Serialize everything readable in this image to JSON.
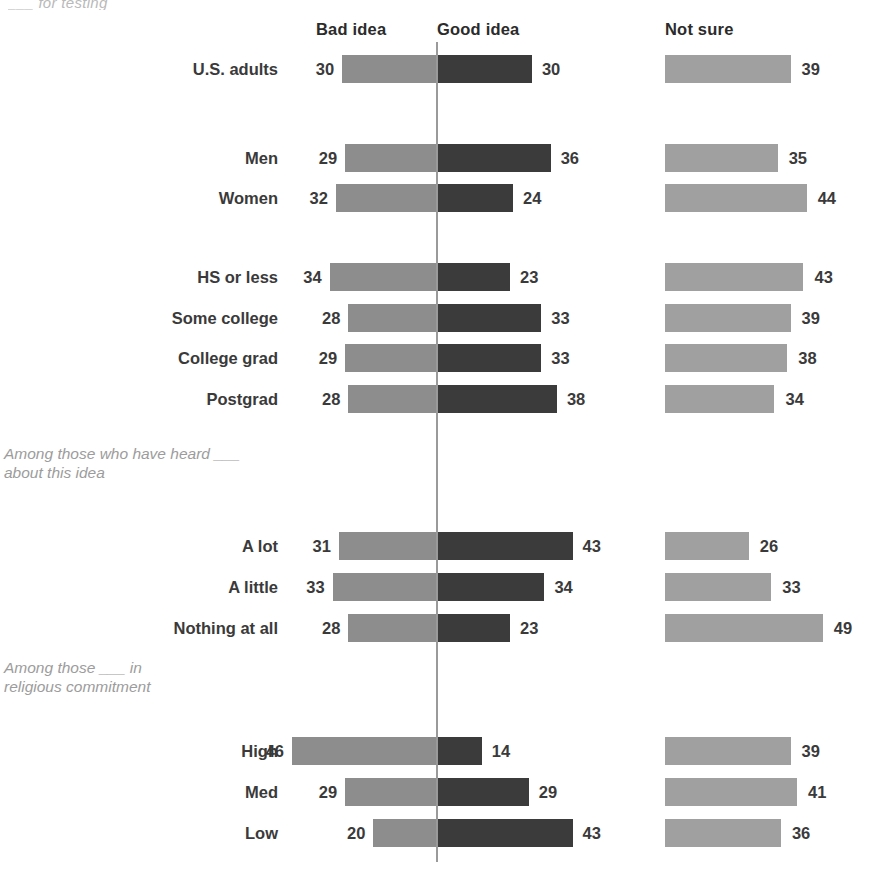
{
  "top_clipped_text": "___ for testing",
  "headers": {
    "bad": "Bad idea",
    "good": "Good idea",
    "not_sure": "Not sure"
  },
  "notes": {
    "heard": "Among those who have heard ___\nabout this idea",
    "religion": "Among those ___ in\nreligious commitment"
  },
  "colors": {
    "bad": "#8d8d8d",
    "good": "#3b3b3b",
    "not_sure": "#a0a0a0",
    "axis": "#9a9a9a",
    "text": "#3a3a3a",
    "note": "#9c9c9c"
  },
  "chart_data": {
    "type": "bar",
    "title": "",
    "subtype": "diverging-stacked",
    "xlabel": "",
    "ylabel": "",
    "legend": [
      "Bad idea",
      "Good idea",
      "Not sure"
    ],
    "legend_position": "top",
    "grid": false,
    "units": "percent",
    "categories": [
      "U.S. adults",
      "Men",
      "Women",
      "HS or less",
      "Some college",
      "College grad",
      "Postgrad",
      "A lot",
      "A little",
      "Nothing at all",
      "High",
      "Med",
      "Low"
    ],
    "series": [
      {
        "name": "Bad idea",
        "values": [
          30,
          29,
          32,
          34,
          28,
          29,
          28,
          31,
          33,
          28,
          46,
          29,
          20
        ]
      },
      {
        "name": "Good idea",
        "values": [
          30,
          36,
          24,
          23,
          33,
          33,
          38,
          43,
          34,
          23,
          14,
          29,
          43
        ]
      },
      {
        "name": "Not sure",
        "values": [
          39,
          35,
          44,
          43,
          39,
          38,
          34,
          26,
          33,
          49,
          39,
          41,
          36
        ]
      }
    ]
  },
  "rows": [
    {
      "label": "U.S. adults",
      "bad": 30,
      "good": 30,
      "not_sure": 39,
      "top": 54,
      "note": null
    },
    {
      "label": "Men",
      "bad": 29,
      "good": 36,
      "not_sure": 35,
      "top": 143,
      "note": null
    },
    {
      "label": "Women",
      "bad": 32,
      "good": 24,
      "not_sure": 44,
      "top": 183,
      "note": null
    },
    {
      "label": "HS or less",
      "bad": 34,
      "good": 23,
      "not_sure": 43,
      "top": 262,
      "note": null
    },
    {
      "label": "Some college",
      "bad": 28,
      "good": 33,
      "not_sure": 39,
      "top": 303,
      "note": null
    },
    {
      "label": "College grad",
      "bad": 29,
      "good": 33,
      "not_sure": 38,
      "top": 343,
      "note": null
    },
    {
      "label": "Postgrad",
      "bad": 28,
      "good": 38,
      "not_sure": 34,
      "top": 384,
      "note": null
    },
    {
      "label": "A lot",
      "bad": 31,
      "good": 43,
      "not_sure": 26,
      "top": 531,
      "note": null
    },
    {
      "label": "A little",
      "bad": 33,
      "good": 34,
      "not_sure": 33,
      "top": 572,
      "note": null
    },
    {
      "label": "Nothing at all",
      "bad": 28,
      "good": 23,
      "not_sure": 49,
      "top": 613,
      "note": null
    },
    {
      "label": "High",
      "bad": 46,
      "good": 14,
      "not_sure": 39,
      "top": 736,
      "note": null
    },
    {
      "label": "Med",
      "bad": 29,
      "good": 29,
      "not_sure": 41,
      "top": 777,
      "note": null
    },
    {
      "label": "Low",
      "bad": 20,
      "good": 43,
      "not_sure": 36,
      "top": 818,
      "note": null
    }
  ]
}
